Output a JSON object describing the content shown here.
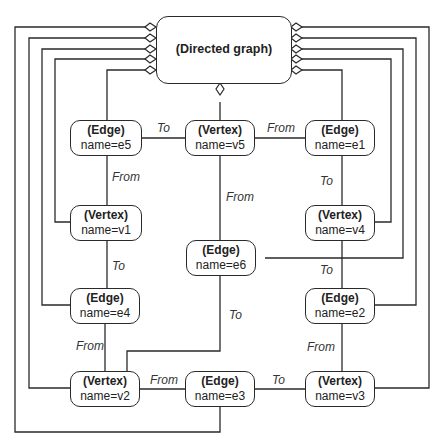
{
  "diagram": {
    "root": {
      "type": "(Directed graph)"
    },
    "nodes": {
      "e5": {
        "type": "(Edge)",
        "name": "name=e5"
      },
      "v5": {
        "type": "(Vertex)",
        "name": "name=v5"
      },
      "e1": {
        "type": "(Edge)",
        "name": "name=e1"
      },
      "v1": {
        "type": "(Vertex)",
        "name": "name=v1"
      },
      "v4": {
        "type": "(Vertex)",
        "name": "name=v4"
      },
      "e6": {
        "type": "(Edge)",
        "name": "name=e6"
      },
      "e4": {
        "type": "(Edge)",
        "name": "name=e4"
      },
      "e2": {
        "type": "(Edge)",
        "name": "name=e2"
      },
      "v2": {
        "type": "(Vertex)",
        "name": "name=v2"
      },
      "e3": {
        "type": "(Edge)",
        "name": "name=e3"
      },
      "v3": {
        "type": "(Vertex)",
        "name": "name=v3"
      }
    },
    "edge_labels": {
      "e5_v5": "To",
      "v5_e1": "From",
      "e5_v1": "From",
      "e1_v4": "To",
      "v5_e6": "From",
      "v1_e4": "To",
      "v4_e2": "To",
      "e6_v2": "To",
      "e4_v2": "From",
      "e2_v3": "From",
      "v2_e3": "From",
      "e3_v3": "To"
    },
    "line_color": "#2a2a2a"
  }
}
